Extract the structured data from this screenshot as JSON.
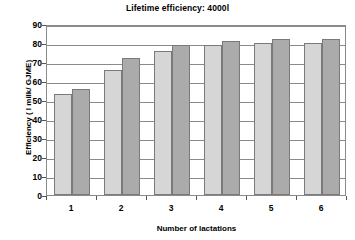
{
  "chart_data": {
    "type": "bar",
    "title": "Lifetime efficiency: 4000l",
    "xlabel": "Number of lactations",
    "ylabel": "Efficiency ( l milk/ GJME)",
    "categories": [
      "1",
      "2",
      "3",
      "4",
      "5",
      "6"
    ],
    "series": [
      {
        "name": "series-1",
        "color": "#d6d6d6",
        "values": [
          53,
          66,
          76,
          79,
          80,
          80
        ]
      },
      {
        "name": "series-2",
        "color": "#ababab",
        "values": [
          56,
          72,
          79,
          81,
          82,
          82
        ]
      }
    ],
    "ylim": [
      0,
      90
    ],
    "ytick_labels": [
      "90",
      "80",
      "70",
      "60",
      "50",
      "40",
      "30",
      "20",
      "10",
      "0"
    ],
    "ytick_values": [
      90,
      80,
      70,
      60,
      50,
      40,
      30,
      20,
      10,
      0
    ],
    "ystep": 10,
    "grid": true,
    "legend": "none",
    "plot_border_color": "#8a8a8a",
    "background_color": "#ffffff"
  }
}
